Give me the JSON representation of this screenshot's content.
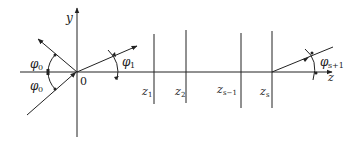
{
  "diagram": {
    "type": "ray-geometry",
    "axes": {
      "horizontal_label": "z",
      "vertical_label": "y",
      "origin_label": "0"
    },
    "angles": {
      "incident_upper": {
        "symbol": "φ",
        "subscript": "0"
      },
      "incident_lower": {
        "symbol": "φ",
        "subscript": "0"
      },
      "first": {
        "symbol": "φ",
        "subscript": "1"
      },
      "last": {
        "symbol": "φ",
        "subscript": "s+1"
      }
    },
    "interfaces": [
      {
        "symbol": "z",
        "subscript": "1"
      },
      {
        "symbol": "z",
        "subscript": "2"
      },
      {
        "symbol": "z",
        "subscript": "s−1"
      },
      {
        "symbol": "z",
        "subscript": "s"
      }
    ],
    "colors": {
      "stroke": "#222222",
      "background": "#ffffff"
    }
  }
}
